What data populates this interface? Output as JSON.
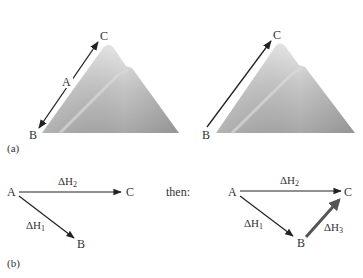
{
  "panel_a": {
    "label": "(a)",
    "left": {
      "point_c": "C",
      "point_a": "A",
      "point_b": "B"
    },
    "right": {
      "point_c": "C",
      "point_b": "B"
    }
  },
  "panel_b": {
    "label": "(b)",
    "left": {
      "point_a": "A",
      "point_b": "B",
      "point_c": "C",
      "dh1": "ΔH",
      "dh1_sub": "1",
      "dh2": "ΔH",
      "dh2_sub": "2"
    },
    "connector": "then:",
    "right": {
      "point_a": "A",
      "point_b": "B",
      "point_c": "C",
      "dh1": "ΔH",
      "dh1_sub": "1",
      "dh2": "ΔH",
      "dh2_sub": "2",
      "dh3": "ΔH",
      "dh3_sub": "3"
    }
  },
  "colors": {
    "arrow": "#222222",
    "thick_arrow": "#555555",
    "mountain_light": "#e6e6e6",
    "mountain_dark": "#9a9a9a"
  }
}
